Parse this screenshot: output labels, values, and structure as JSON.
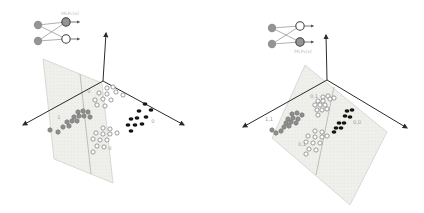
{
  "figure": {
    "background": "#ffffff",
    "width": 424,
    "height": 213
  },
  "colors": {
    "plane_fill": "#eeeeea",
    "plane_texture_dot": "#d7d7d0",
    "plane_stroke": "#c6c6c0",
    "divider": "#b2b2ac",
    "axis": "#2b2b2b",
    "gray_marker": "#8e8e8e",
    "gray_marker_stroke": "#6e6e6e",
    "open_marker_stroke": "#8a8a8a",
    "open_marker_fill": "#ffffff",
    "black_marker": "#141414",
    "cluster_label": "#a0a0a0",
    "net_node_gray": "#949494",
    "net_node_white": "#ffffff",
    "net_node_stroke": "#3f3f3f",
    "net_edge": "#9a9a9a",
    "net_arrow": "#555555",
    "net_label": "#b9b9b5"
  },
  "chart_data": {
    "type": "scatter",
    "title": "",
    "subtitle": "",
    "description_labels": [
      "1",
      "0",
      "0",
      "0",
      "1,1",
      "0,1",
      "0,0",
      "0,1",
      "MLP₁(x)",
      "MLP₂(x)"
    ],
    "panels": [
      {
        "id": "left",
        "network": {
          "label": "MLP₁(x)",
          "label_xy": [
            70,
            15
          ],
          "inputs": [
            [
              38,
              25
            ],
            [
              38,
              41
            ]
          ],
          "outputs": [
            {
              "xy": [
                66,
                22
              ],
              "fill": "gray"
            },
            {
              "xy": [
                66,
                39
              ],
              "fill": "white"
            }
          ],
          "arrow_len": 9
        },
        "axes": {
          "origin": [
            103,
            81
          ],
          "up": [
            106,
            33
          ],
          "left": [
            23,
            125
          ],
          "right": [
            184,
            125
          ]
        },
        "plane": {
          "polygon": [
            [
              43,
              59
            ],
            [
              102,
              83
            ],
            [
              113,
              183
            ],
            [
              54,
              159
            ]
          ],
          "divider": [
            [
              80,
              74
            ],
            [
              91,
              174
            ]
          ]
        },
        "clusters": [
          {
            "name": "class-1-gray",
            "marker": "hexagon",
            "label": "1",
            "label_xy": [
              59,
              117
            ],
            "points": [
              [
                78,
                112
              ],
              [
                83,
                111
              ],
              [
                88,
                112
              ],
              [
                74,
                117
              ],
              [
                79,
                116
              ],
              [
                84,
                116
              ],
              [
                90,
                117
              ],
              [
                67,
                122
              ],
              [
                72,
                121
              ],
              [
                77,
                121
              ],
              [
                63,
                127
              ],
              [
                69,
                126
              ],
              [
                50,
                130
              ],
              [
                58,
                132
              ]
            ]
          },
          {
            "name": "class-0-open-top",
            "marker": "open",
            "label": "0",
            "label_xy": [
              89,
              91
            ],
            "points": [
              [
                107,
                88
              ],
              [
                113,
                87
              ],
              [
                99,
                93
              ],
              [
                107,
                94
              ],
              [
                116,
                92
              ],
              [
                123,
                95
              ],
              [
                95,
                100
              ],
              [
                103,
                99
              ],
              [
                111,
                100
              ],
              [
                97,
                105
              ],
              [
                105,
                106
              ]
            ]
          },
          {
            "name": "class-0-black",
            "marker": "black",
            "label": "0",
            "label_xy": [
              153,
              121
            ],
            "points": [
              [
                145,
                104
              ],
              [
                151,
                110
              ],
              [
                139,
                111
              ],
              [
                146,
                117
              ],
              [
                131,
                119
              ],
              [
                137,
                118
              ],
              [
                128,
                125
              ],
              [
                135,
                125
              ],
              [
                142,
                124
              ],
              [
                131,
                131
              ]
            ]
          },
          {
            "name": "class-0-open-bottom",
            "marker": "open",
            "label": "0",
            "label_xy": [
              110,
              148
            ],
            "points": [
              [
                103,
                128
              ],
              [
                110,
                129
              ],
              [
                96,
                133
              ],
              [
                103,
                134
              ],
              [
                110,
                134
              ],
              [
                117,
                133
              ],
              [
                93,
                139
              ],
              [
                100,
                140
              ],
              [
                107,
                140
              ],
              [
                97,
                146
              ],
              [
                104,
                147
              ],
              [
                93,
                152
              ]
            ]
          }
        ]
      },
      {
        "id": "right",
        "network": {
          "label": "MLP₂(x)",
          "label_xy": [
            303,
            53
          ],
          "inputs": [
            [
              272,
              28
            ],
            [
              272,
              44
            ]
          ],
          "outputs": [
            {
              "xy": [
                300,
                26
              ],
              "fill": "white"
            },
            {
              "xy": [
                300,
                42
              ],
              "fill": "gray"
            }
          ],
          "arrow_len": 9
        },
        "axes": {
          "origin": [
            327,
            80
          ],
          "up": [
            326,
            35
          ],
          "left": [
            243,
            127
          ],
          "right": [
            407,
            128
          ]
        },
        "plane": {
          "polygon": [
            [
              305,
              65
            ],
            [
              387,
              132
            ],
            [
              350,
              205
            ],
            [
              272,
              138
            ]
          ],
          "divider": [
            [
              334,
              87
            ],
            [
              316,
              175
            ]
          ]
        },
        "clusters": [
          {
            "name": "class-11-gray",
            "marker": "hexagon",
            "label": "1,1",
            "label_xy": [
              269,
              119
            ],
            "points": [
              [
                292,
                114
              ],
              [
                297,
                113
              ],
              [
                302,
                115
              ],
              [
                288,
                119
              ],
              [
                293,
                118
              ],
              [
                298,
                119
              ],
              [
                286,
                123
              ],
              [
                291,
                122
              ],
              [
                296,
                123
              ],
              [
                284,
                127
              ],
              [
                289,
                126
              ],
              [
                272,
                130
              ],
              [
                281,
                131
              ],
              [
                276,
                133
              ]
            ]
          },
          {
            "name": "class-01-open-top",
            "marker": "open",
            "label": "0,1",
            "label_xy": [
              314,
              96
            ],
            "points": [
              [
                323,
                97
              ],
              [
                328,
                96
              ],
              [
                334,
                98
              ],
              [
                318,
                101
              ],
              [
                323,
                101
              ],
              [
                330,
                99
              ],
              [
                315,
                105
              ],
              [
                320,
                105
              ],
              [
                325,
                105
              ],
              [
                317,
                110
              ],
              [
                322,
                110
              ],
              [
                327,
                109
              ],
              [
                318,
                115
              ]
            ]
          },
          {
            "name": "class-00-black",
            "marker": "black",
            "label": "0,0",
            "label_xy": [
              357,
              122
            ],
            "points": [
              [
                352,
                110
              ],
              [
                347,
                111
              ],
              [
                345,
                116
              ],
              [
                350,
                117
              ],
              [
                339,
                123
              ],
              [
                344,
                123
              ],
              [
                336,
                128
              ],
              [
                341,
                128
              ],
              [
                334,
                132
              ]
            ]
          },
          {
            "name": "class-01-open-bottom",
            "marker": "open",
            "label": "0,1",
            "label_xy": [
              302,
              144
            ],
            "points": [
              [
                315,
                131
              ],
              [
                322,
                132
              ],
              [
                308,
                136
              ],
              [
                315,
                137
              ],
              [
                322,
                137
              ],
              [
                327,
                136
              ],
              [
                306,
                142
              ],
              [
                313,
                143
              ],
              [
                320,
                143
              ],
              [
                309,
                149
              ],
              [
                316,
                150
              ],
              [
                306,
                154
              ]
            ]
          }
        ]
      }
    ]
  }
}
